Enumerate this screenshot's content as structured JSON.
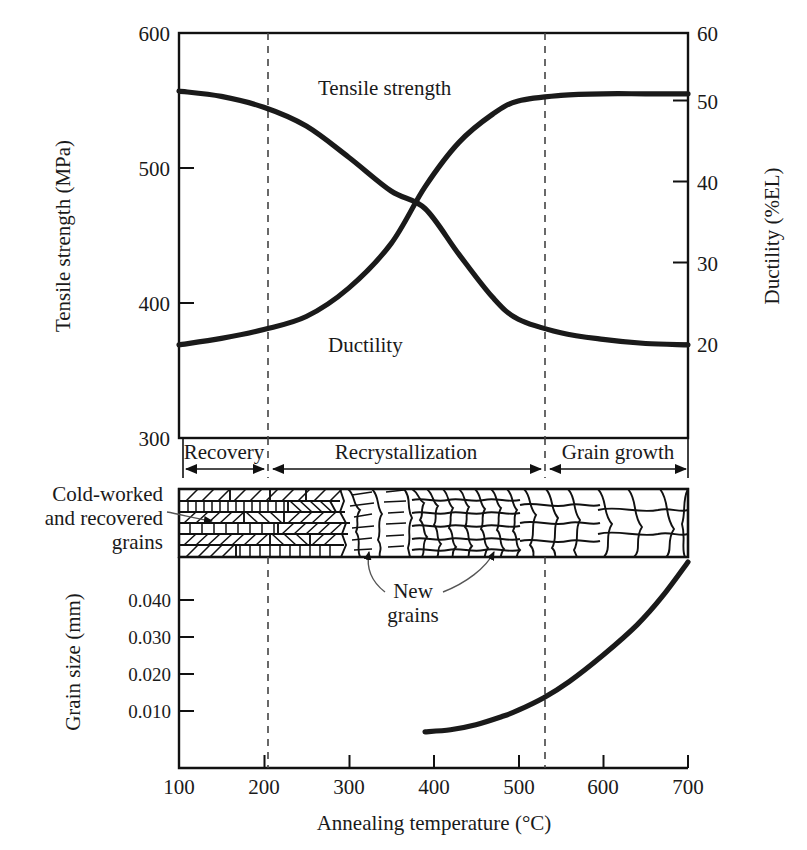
{
  "figure": {
    "title": "",
    "background": "#ffffff",
    "curve_color": "#1a1a1a",
    "axis_color": "#111111"
  },
  "chart_data": [
    {
      "type": "line",
      "id": "properties-panel",
      "title": "",
      "xlabel": "Annealing temperature (°C)",
      "ylabel": "Tensile strength (MPa)",
      "y2label": "Ductility (%EL)",
      "xlim": [
        100,
        700
      ],
      "ylim": [
        300,
        600
      ],
      "y2lim": [
        10,
        60
      ],
      "xticks": [
        100,
        200,
        300,
        400,
        500,
        600,
        700
      ],
      "yticks": [
        300,
        400,
        500,
        600
      ],
      "y2ticks": [
        20,
        30,
        40,
        50,
        60
      ],
      "grid": false,
      "legend": "inline-labels",
      "series": [
        {
          "name": "Tensile strength",
          "axis": "left",
          "unit": "MPa",
          "x": [
            100,
            150,
            200,
            250,
            300,
            350,
            390,
            430,
            470,
            500,
            550,
            600,
            650,
            700
          ],
          "values": [
            557,
            553,
            545,
            531,
            508,
            483,
            470,
            436,
            404,
            388,
            378,
            373,
            370,
            369
          ]
        },
        {
          "name": "Ductility",
          "axis": "right",
          "unit": "%EL",
          "x": [
            100,
            150,
            200,
            250,
            300,
            350,
            390,
            430,
            470,
            500,
            550,
            600,
            650,
            700
          ],
          "values": [
            21.5,
            22.3,
            23.4,
            25.0,
            28.5,
            34.0,
            41.0,
            46.5,
            50.0,
            51.6,
            52.3,
            52.5,
            52.5,
            52.5
          ]
        }
      ],
      "annotations": [
        {
          "text": "Tensile strength",
          "x": 320,
          "y": 556
        },
        {
          "text": "Ductility",
          "x": 330,
          "y": 27
        }
      ],
      "region_boundaries": [
        200,
        500
      ],
      "regions": [
        {
          "label": "Recovery",
          "from": 100,
          "to": 200
        },
        {
          "label": "Recrystallization",
          "from": 200,
          "to": 500
        },
        {
          "label": "Grain growth",
          "from": 500,
          "to": 700
        }
      ]
    },
    {
      "type": "line",
      "id": "grain-size-panel",
      "title": "",
      "xlabel": "Annealing temperature (°C)",
      "ylabel": "Grain size (mm)",
      "xlim": [
        100,
        700
      ],
      "ylim": [
        0.004,
        0.046
      ],
      "xticks": [
        100,
        200,
        300,
        400,
        500,
        600,
        700
      ],
      "yticks": [
        0.01,
        0.02,
        0.03,
        0.04
      ],
      "ytick_labels": [
        "0.010",
        "0.020",
        "0.030",
        "0.040"
      ],
      "grid": false,
      "series": [
        {
          "name": "Grain size",
          "unit": "mm",
          "x": [
            390,
            420,
            450,
            480,
            500,
            530,
            560,
            600,
            640,
            670,
            700
          ],
          "values": [
            0.0112,
            0.0116,
            0.0126,
            0.0142,
            0.0155,
            0.018,
            0.0212,
            0.0265,
            0.0325,
            0.0382,
            0.045
          ]
        }
      ],
      "region_boundaries": [
        200,
        500
      ]
    }
  ],
  "microstructure": {
    "band_label": "grain structure strip",
    "x_from": 100,
    "x_to": 700,
    "annotations": [
      {
        "name": "cold-worked-callout",
        "lines": [
          "Cold-worked",
          "and recovered",
          "grains"
        ],
        "text": "Cold-worked and recovered grains"
      },
      {
        "name": "new-grains-callout",
        "lines": [
          "New",
          "grains"
        ],
        "text": "New grains"
      }
    ],
    "zones": [
      {
        "name": "deformed-elongated-grains",
        "from": 100,
        "to": 330
      },
      {
        "name": "partially-recrystallized",
        "from": 330,
        "to": 420
      },
      {
        "name": "fine-new-grains",
        "from": 420,
        "to": 520
      },
      {
        "name": "grown-grains",
        "from": 520,
        "to": 700
      }
    ]
  },
  "axis_text": {
    "y_left_top": "Tensile strength (MPa)",
    "y_right_top": "Ductility (%EL)",
    "y_left_bottom": "Grain size (mm)",
    "x_bottom": "Annealing temperature (°C)"
  }
}
